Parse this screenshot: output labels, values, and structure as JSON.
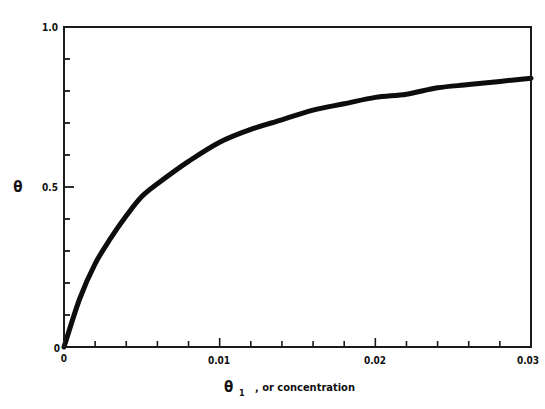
{
  "chart_data": {
    "type": "line",
    "title": "",
    "xlabel": "θ₁ , or concentration",
    "xlabel_main": "θ",
    "xlabel_sub": "1",
    "xlabel_rest": ", or concentration",
    "ylabel": "θ",
    "xlim": [
      0,
      0.03
    ],
    "ylim": [
      0,
      1.0
    ],
    "grid": false,
    "legend": null,
    "x_tick_labels": [
      "0",
      "0.01",
      "0.02",
      "0.03"
    ],
    "x_tick_values": [
      0,
      0.01,
      0.02,
      0.03
    ],
    "x_minor_step": 0.002,
    "y_tick_labels": [
      "0",
      "0.5",
      "1.0"
    ],
    "y_tick_values": [
      0,
      0.5,
      1.0
    ],
    "y_minor_step": 0.1,
    "series": [
      {
        "name": "θ vs concentration",
        "x": [
          0,
          0.001,
          0.002,
          0.003,
          0.004,
          0.005,
          0.006,
          0.008,
          0.01,
          0.012,
          0.014,
          0.016,
          0.018,
          0.02,
          0.022,
          0.024,
          0.026,
          0.028,
          0.03
        ],
        "y": [
          0,
          0.15,
          0.26,
          0.34,
          0.41,
          0.47,
          0.51,
          0.58,
          0.64,
          0.68,
          0.71,
          0.74,
          0.76,
          0.78,
          0.79,
          0.81,
          0.82,
          0.83,
          0.84
        ]
      }
    ]
  }
}
